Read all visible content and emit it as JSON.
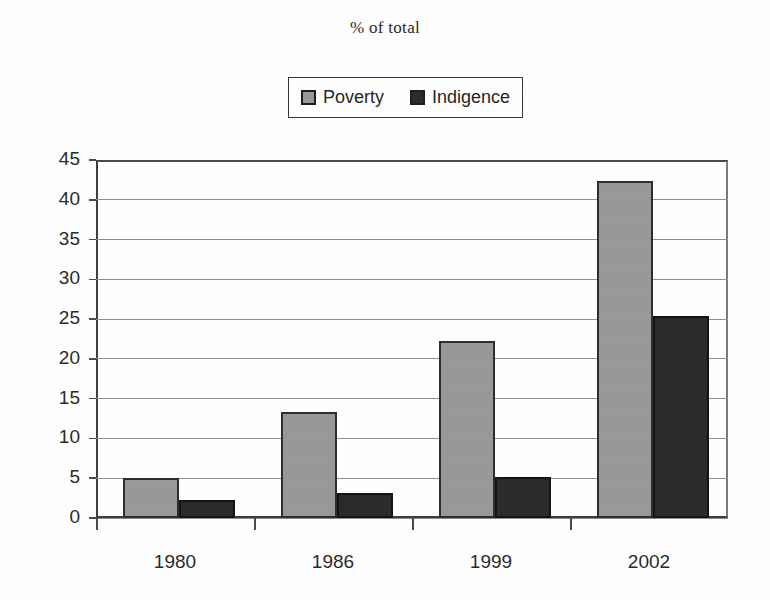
{
  "chart_data": {
    "type": "bar",
    "title": "% of total",
    "xlabel": "",
    "ylabel": "",
    "categories": [
      "1980",
      "1986",
      "1999",
      "2002"
    ],
    "series": [
      {
        "name": "Poverty",
        "color": "#999999",
        "values": [
          5.0,
          13.3,
          22.3,
          42.3
        ]
      },
      {
        "name": "Indigence",
        "color": "#2b2b2b",
        "values": [
          2.2,
          3.2,
          5.2,
          25.4
        ]
      }
    ],
    "ylim": [
      0,
      45
    ],
    "ytick_labels": [
      "45",
      "40",
      "35",
      "30",
      "25",
      "20",
      "15",
      "10",
      "5",
      "0"
    ],
    "ytick_values": [
      45,
      40,
      35,
      30,
      25,
      20,
      15,
      10,
      5,
      0
    ],
    "grid": true,
    "legend_position": "top-center"
  },
  "legend": {
    "entries": [
      {
        "label": "Poverty",
        "swatch": "legend-swatch-poverty"
      },
      {
        "label": "Indigence",
        "swatch": "legend-swatch-indigence"
      }
    ]
  }
}
